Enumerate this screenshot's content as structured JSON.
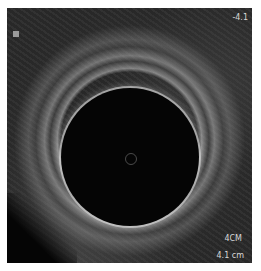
{
  "image": {
    "type": "ultrasound",
    "labels": {
      "depth_top": "-4.1",
      "depth_cm": "4CM",
      "depth_bottom": "4.1 cm"
    },
    "colors": {
      "background": "#ffffff",
      "tissue": "#2a2a2a",
      "cavity": "#050505",
      "text": "#d8d8d8"
    }
  }
}
